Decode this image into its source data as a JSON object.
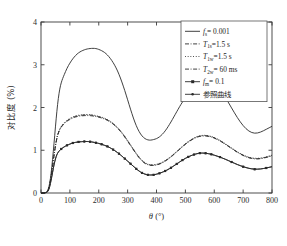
{
  "chart_data": {
    "type": "line",
    "title": "",
    "xlabel": "θ (°)",
    "ylabel": "对比度 (%)",
    "xlim": [
      0,
      800
    ],
    "ylim": [
      0,
      4
    ],
    "xticks": [
      0,
      100,
      200,
      300,
      400,
      500,
      600,
      700,
      800
    ],
    "yticks": [
      0,
      1,
      2,
      3,
      4
    ],
    "xtick_labels": [
      "0",
      "100",
      "200",
      "300",
      "400",
      "500",
      "600",
      "700",
      "800"
    ],
    "ytick_labels": [
      "0",
      "1",
      "2",
      "3",
      "4"
    ],
    "grid": false,
    "legend_position": "top-right",
    "series": [
      {
        "name": "fs_0p001",
        "legend_label": "= 0.001",
        "legend_symbol": "f",
        "legend_subscript": "s",
        "style": "solid",
        "marker": "none",
        "x": [
          0,
          10,
          20,
          25,
          30,
          35,
          40,
          45,
          50,
          55,
          60,
          65,
          70,
          75,
          80,
          90,
          100,
          110,
          120,
          130,
          140,
          150,
          160,
          170,
          180,
          190,
          200,
          210,
          220,
          230,
          240,
          250,
          260,
          270,
          280,
          290,
          300,
          310,
          320,
          330,
          340,
          350,
          360,
          370,
          380,
          390,
          400,
          410,
          420,
          430,
          440,
          450,
          460,
          470,
          480,
          490,
          500,
          510,
          520,
          530,
          540,
          550,
          560,
          570,
          580,
          590,
          600,
          620,
          640,
          660,
          680,
          700,
          720,
          740,
          760,
          780,
          800
        ],
        "y": [
          0.0,
          0.0,
          0.02,
          0.08,
          0.22,
          0.45,
          0.78,
          1.15,
          1.55,
          1.92,
          2.22,
          2.44,
          2.58,
          2.68,
          2.76,
          2.92,
          3.04,
          3.14,
          3.22,
          3.28,
          3.32,
          3.35,
          3.37,
          3.38,
          3.385,
          3.38,
          3.36,
          3.33,
          3.29,
          3.23,
          3.15,
          3.05,
          2.93,
          2.78,
          2.6,
          2.4,
          2.18,
          1.96,
          1.75,
          1.57,
          1.43,
          1.33,
          1.27,
          1.24,
          1.235,
          1.25,
          1.27,
          1.31,
          1.37,
          1.45,
          1.55,
          1.66,
          1.78,
          1.9,
          2.02,
          2.13,
          2.23,
          2.32,
          2.4,
          2.47,
          2.53,
          2.57,
          2.6,
          2.615,
          2.61,
          2.59,
          2.55,
          2.42,
          2.22,
          1.99,
          1.76,
          1.57,
          1.44,
          1.39,
          1.42,
          1.49,
          1.56
        ]
      },
      {
        "name": "T1s_1p5s",
        "legend_label": "=1.5 s",
        "legend_symbol": "T",
        "legend_subscript": "1s",
        "style": "dashdot",
        "marker": "none",
        "x": [
          0,
          10,
          20,
          25,
          30,
          35,
          40,
          45,
          50,
          55,
          60,
          65,
          70,
          80,
          90,
          100,
          110,
          120,
          130,
          140,
          150,
          160,
          170,
          180,
          190,
          200,
          210,
          220,
          230,
          240,
          250,
          260,
          270,
          280,
          290,
          300,
          310,
          320,
          330,
          340,
          350,
          360,
          370,
          380,
          390,
          400,
          410,
          420,
          430,
          440,
          450,
          460,
          470,
          480,
          490,
          500,
          510,
          520,
          530,
          540,
          550,
          560,
          570,
          580,
          590,
          600,
          620,
          640,
          660,
          680,
          700,
          720,
          740,
          760,
          780,
          800
        ],
        "y": [
          0.0,
          0.0,
          0.01,
          0.06,
          0.18,
          0.38,
          0.62,
          0.88,
          1.1,
          1.28,
          1.4,
          1.48,
          1.54,
          1.62,
          1.68,
          1.72,
          1.755,
          1.78,
          1.795,
          1.805,
          1.81,
          1.812,
          1.81,
          1.8,
          1.79,
          1.775,
          1.755,
          1.73,
          1.7,
          1.66,
          1.61,
          1.55,
          1.48,
          1.4,
          1.31,
          1.21,
          1.11,
          1.01,
          0.91,
          0.82,
          0.745,
          0.69,
          0.66,
          0.645,
          0.645,
          0.655,
          0.675,
          0.705,
          0.745,
          0.79,
          0.84,
          0.9,
          0.96,
          1.02,
          1.08,
          1.14,
          1.19,
          1.235,
          1.275,
          1.305,
          1.325,
          1.335,
          1.335,
          1.325,
          1.31,
          1.285,
          1.22,
          1.13,
          1.04,
          0.95,
          0.875,
          0.82,
          0.795,
          0.8,
          0.83,
          0.87
        ]
      },
      {
        "name": "T1w_1p5s",
        "legend_label": "=1.5 s",
        "legend_symbol": "T",
        "legend_subscript": "1w",
        "style": "dotted",
        "marker": "none",
        "x": [
          0,
          10,
          20,
          25,
          30,
          35,
          40,
          45,
          50,
          55,
          60,
          65,
          70,
          80,
          90,
          100,
          110,
          120,
          130,
          140,
          150,
          160,
          170,
          180,
          190,
          200,
          210,
          220,
          230,
          240,
          250,
          260,
          270,
          280,
          290,
          300,
          310,
          320,
          330,
          340,
          350,
          360,
          370,
          380,
          390,
          400,
          410,
          420,
          430,
          440,
          450,
          460,
          470,
          480,
          490,
          500,
          510,
          520,
          530,
          540,
          550,
          560,
          570,
          580,
          590,
          600,
          620,
          640,
          660,
          680,
          700,
          720,
          740,
          760,
          780,
          800
        ],
        "y": [
          0.0,
          0.0,
          0.01,
          0.06,
          0.18,
          0.38,
          0.63,
          0.89,
          1.12,
          1.3,
          1.42,
          1.5,
          1.56,
          1.645,
          1.7,
          1.745,
          1.78,
          1.805,
          1.82,
          1.83,
          1.835,
          1.837,
          1.835,
          1.825,
          1.81,
          1.795,
          1.775,
          1.75,
          1.72,
          1.68,
          1.63,
          1.57,
          1.5,
          1.42,
          1.33,
          1.23,
          1.13,
          1.03,
          0.93,
          0.84,
          0.765,
          0.71,
          0.675,
          0.66,
          0.66,
          0.67,
          0.69,
          0.72,
          0.76,
          0.805,
          0.855,
          0.915,
          0.975,
          1.035,
          1.095,
          1.155,
          1.205,
          1.25,
          1.29,
          1.32,
          1.34,
          1.35,
          1.35,
          1.34,
          1.325,
          1.3,
          1.235,
          1.145,
          1.055,
          0.965,
          0.89,
          0.835,
          0.81,
          0.815,
          0.845,
          0.885
        ]
      },
      {
        "name": "T2w_60ms",
        "legend_label": "= 60 ms",
        "legend_symbol": "T",
        "legend_subscript": "2w",
        "style": "dashdot",
        "marker": "none",
        "x": [
          0,
          10,
          20,
          25,
          30,
          35,
          40,
          45,
          50,
          55,
          60,
          65,
          70,
          80,
          90,
          100,
          110,
          120,
          130,
          140,
          150,
          160,
          170,
          180,
          190,
          200,
          210,
          220,
          230,
          240,
          250,
          260,
          270,
          280,
          290,
          300,
          310,
          320,
          330,
          340,
          350,
          360,
          370,
          380,
          390,
          400,
          410,
          420,
          430,
          440,
          450,
          460,
          470,
          480,
          490,
          500,
          510,
          520,
          530,
          540,
          550,
          560,
          570,
          580,
          590,
          600,
          620,
          640,
          660,
          680,
          700,
          720,
          740,
          760,
          780,
          800
        ],
        "y": [
          0.0,
          0.0,
          0.01,
          0.06,
          0.18,
          0.38,
          0.62,
          0.88,
          1.11,
          1.29,
          1.41,
          1.49,
          1.55,
          1.635,
          1.69,
          1.735,
          1.77,
          1.795,
          1.81,
          1.82,
          1.825,
          1.827,
          1.825,
          1.815,
          1.8,
          1.785,
          1.765,
          1.74,
          1.71,
          1.67,
          1.62,
          1.56,
          1.49,
          1.41,
          1.32,
          1.22,
          1.12,
          1.02,
          0.92,
          0.83,
          0.755,
          0.7,
          0.667,
          0.652,
          0.652,
          0.662,
          0.682,
          0.712,
          0.752,
          0.797,
          0.847,
          0.907,
          0.967,
          1.027,
          1.087,
          1.147,
          1.197,
          1.242,
          1.282,
          1.312,
          1.332,
          1.342,
          1.342,
          1.332,
          1.317,
          1.292,
          1.227,
          1.137,
          1.047,
          0.957,
          0.882,
          0.827,
          0.802,
          0.807,
          0.837,
          0.877
        ]
      },
      {
        "name": "fm_0p1",
        "legend_label": "= 0.1",
        "legend_symbol": "f",
        "legend_subscript": "m",
        "style": "solid",
        "marker": "square",
        "x": [
          0,
          10,
          20,
          25,
          30,
          35,
          40,
          45,
          50,
          55,
          60,
          65,
          70,
          80,
          90,
          100,
          110,
          120,
          130,
          140,
          150,
          160,
          170,
          180,
          190,
          200,
          210,
          220,
          230,
          240,
          250,
          260,
          270,
          280,
          290,
          300,
          310,
          320,
          330,
          340,
          350,
          360,
          370,
          380,
          390,
          400,
          410,
          420,
          430,
          440,
          450,
          460,
          470,
          480,
          490,
          500,
          510,
          520,
          530,
          540,
          550,
          560,
          570,
          580,
          590,
          600,
          620,
          640,
          660,
          680,
          700,
          720,
          740,
          760,
          780,
          800
        ],
        "y": [
          0.0,
          0.0,
          0.01,
          0.05,
          0.14,
          0.3,
          0.48,
          0.66,
          0.8,
          0.9,
          0.96,
          1.0,
          1.03,
          1.08,
          1.115,
          1.145,
          1.17,
          1.185,
          1.195,
          1.2,
          1.205,
          1.205,
          1.2,
          1.19,
          1.175,
          1.16,
          1.14,
          1.115,
          1.09,
          1.055,
          1.015,
          0.97,
          0.92,
          0.865,
          0.805,
          0.745,
          0.685,
          0.625,
          0.565,
          0.51,
          0.47,
          0.44,
          0.425,
          0.42,
          0.425,
          0.44,
          0.46,
          0.485,
          0.515,
          0.55,
          0.59,
          0.635,
          0.68,
          0.725,
          0.77,
          0.81,
          0.845,
          0.875,
          0.9,
          0.92,
          0.932,
          0.935,
          0.93,
          0.92,
          0.905,
          0.885,
          0.84,
          0.785,
          0.725,
          0.665,
          0.615,
          0.575,
          0.555,
          0.56,
          0.585,
          0.615
        ]
      },
      {
        "name": "reference_curve",
        "legend_label": "参照曲线",
        "legend_symbol": "",
        "legend_subscript": "",
        "style": "solid",
        "marker": "dot",
        "x": [
          0,
          10,
          20,
          25,
          30,
          35,
          40,
          45,
          50,
          55,
          60,
          65,
          70,
          80,
          90,
          100,
          110,
          120,
          130,
          140,
          150,
          160,
          170,
          180,
          190,
          200,
          210,
          220,
          230,
          240,
          250,
          260,
          270,
          280,
          290,
          300,
          310,
          320,
          330,
          340,
          350,
          360,
          370,
          380,
          390,
          400,
          410,
          420,
          430,
          440,
          450,
          460,
          470,
          480,
          490,
          500,
          510,
          520,
          530,
          540,
          550,
          560,
          570,
          580,
          590,
          600,
          620,
          640,
          660,
          680,
          700,
          720,
          740,
          760,
          780,
          800
        ],
        "y": [
          0.0,
          0.0,
          0.01,
          0.05,
          0.14,
          0.3,
          0.48,
          0.66,
          0.8,
          0.9,
          0.96,
          1.0,
          1.03,
          1.08,
          1.115,
          1.145,
          1.17,
          1.185,
          1.195,
          1.2,
          1.205,
          1.205,
          1.2,
          1.19,
          1.175,
          1.16,
          1.14,
          1.115,
          1.09,
          1.055,
          1.015,
          0.97,
          0.92,
          0.865,
          0.805,
          0.745,
          0.685,
          0.625,
          0.565,
          0.51,
          0.47,
          0.44,
          0.425,
          0.42,
          0.425,
          0.44,
          0.46,
          0.485,
          0.515,
          0.55,
          0.59,
          0.635,
          0.68,
          0.725,
          0.77,
          0.81,
          0.845,
          0.875,
          0.9,
          0.92,
          0.932,
          0.935,
          0.93,
          0.92,
          0.905,
          0.885,
          0.84,
          0.785,
          0.725,
          0.665,
          0.615,
          0.575,
          0.555,
          0.56,
          0.585,
          0.615
        ]
      }
    ]
  },
  "colors": {
    "axis": "#3a3a3a",
    "curve": "#2a2a2a",
    "legend_border": "#555555",
    "background": "#ffffff"
  }
}
